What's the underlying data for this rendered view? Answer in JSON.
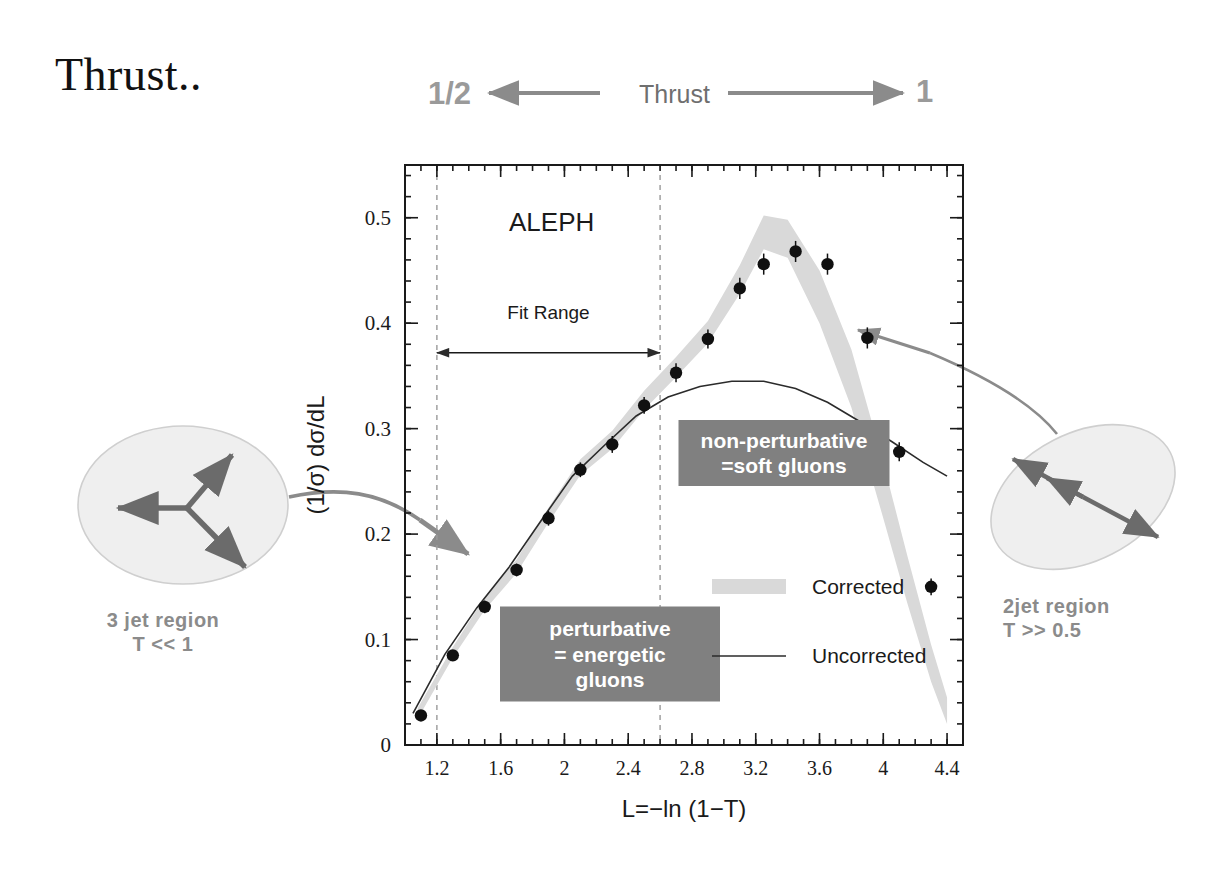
{
  "slide": {
    "title": "Thrust..",
    "header": {
      "left_value": "1/2",
      "center_label": "Thrust",
      "right_value": "1"
    }
  },
  "annotations": {
    "left": {
      "line1": "3 jet region",
      "line2": "T << 1"
    },
    "right": {
      "line1": "2jet region",
      "line2": "T >> 0.5"
    },
    "in_plot": {
      "experiment": "ALEPH",
      "fit_range": "Fit Range",
      "perturbative": [
        "perturbative",
        "= energetic",
        "gluons"
      ],
      "non_perturbative": [
        "non-perturbative",
        "=soft gluons"
      ]
    }
  },
  "colors": {
    "band": "#d9d9d9",
    "gray_text": "#8b8b8b",
    "box_fill": "#808080",
    "box_text": "#ffffff",
    "axis": "#1a1a1a",
    "marker": "#101010",
    "uncorrected": "#2b2b2b",
    "ellipse_fill": "#efefef",
    "ellipse_stroke": "#c9c9c9",
    "arrow_gray": "#8b8b8b"
  },
  "chart_data": {
    "type": "scatter",
    "title": "ALEPH",
    "xlabel": "L=−ln (1−T)",
    "ylabel": "(1/σ) dσ/dL",
    "xlim": [
      1.0,
      4.5
    ],
    "ylim": [
      0,
      0.55
    ],
    "xticks": [
      1.2,
      1.6,
      2,
      2.4,
      2.8,
      3.2,
      3.6,
      4,
      4.4
    ],
    "xtick_labels": [
      "1.2",
      "1.6",
      "2",
      "2.4",
      "2.8",
      "3.2",
      "3.6",
      "4",
      "4.4"
    ],
    "yticks": [
      0,
      0.1,
      0.2,
      0.3,
      0.4,
      0.5
    ],
    "ytick_labels": [
      "0",
      "0.1",
      "0.2",
      "0.3",
      "0.4",
      "0.5"
    ],
    "grid": false,
    "legend_position": "inside-right",
    "legend": [
      {
        "name": "Corrected",
        "style": "band"
      },
      {
        "name": "Uncorrected",
        "style": "line"
      }
    ],
    "fit_range": [
      1.2,
      2.6
    ],
    "series": [
      {
        "name": "ALEPH data",
        "style": "points",
        "x": [
          1.1,
          1.3,
          1.5,
          1.7,
          1.9,
          2.1,
          2.3,
          2.5,
          2.7,
          2.9,
          3.1,
          3.25,
          3.45,
          3.65,
          3.9,
          4.1,
          4.3
        ],
        "y": [
          0.028,
          0.085,
          0.131,
          0.166,
          0.215,
          0.261,
          0.285,
          0.322,
          0.353,
          0.385,
          0.433,
          0.456,
          0.468,
          0.456,
          0.386,
          0.278,
          0.15
        ],
        "yerr": [
          0.004,
          0.005,
          0.006,
          0.006,
          0.007,
          0.007,
          0.008,
          0.008,
          0.009,
          0.009,
          0.01,
          0.01,
          0.01,
          0.01,
          0.01,
          0.009,
          0.008
        ]
      },
      {
        "name": "Corrected",
        "style": "band",
        "x": [
          1.08,
          1.3,
          1.5,
          1.7,
          1.9,
          2.1,
          2.3,
          2.5,
          2.7,
          2.9,
          3.1,
          3.25,
          3.4,
          3.6,
          3.8,
          4.0,
          4.15,
          4.3,
          4.4
        ],
        "y_low": [
          0.025,
          0.083,
          0.128,
          0.163,
          0.211,
          0.256,
          0.281,
          0.318,
          0.349,
          0.381,
          0.428,
          0.47,
          0.462,
          0.4,
          0.32,
          0.215,
          0.135,
          0.06,
          0.02
        ],
        "y_high": [
          0.035,
          0.093,
          0.14,
          0.176,
          0.225,
          0.271,
          0.298,
          0.336,
          0.368,
          0.402,
          0.455,
          0.502,
          0.498,
          0.45,
          0.375,
          0.268,
          0.18,
          0.095,
          0.045
        ]
      },
      {
        "name": "Uncorrected",
        "style": "line",
        "x": [
          1.05,
          1.25,
          1.45,
          1.65,
          1.85,
          2.05,
          2.25,
          2.45,
          2.65,
          2.85,
          3.05,
          3.25,
          3.45,
          3.65,
          3.85,
          4.05,
          4.25,
          4.4
        ],
        "y": [
          0.03,
          0.086,
          0.13,
          0.168,
          0.212,
          0.255,
          0.284,
          0.312,
          0.33,
          0.34,
          0.345,
          0.345,
          0.338,
          0.325,
          0.307,
          0.288,
          0.268,
          0.255
        ]
      }
    ]
  }
}
